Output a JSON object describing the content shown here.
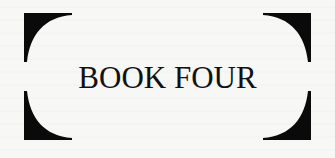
{
  "heading": {
    "title": "BOOK FOUR"
  },
  "decoration": {
    "frame_color": "#0a0a0a",
    "corners": [
      "top-left-corner",
      "top-right-corner",
      "bottom-left-corner",
      "bottom-right-corner"
    ]
  }
}
